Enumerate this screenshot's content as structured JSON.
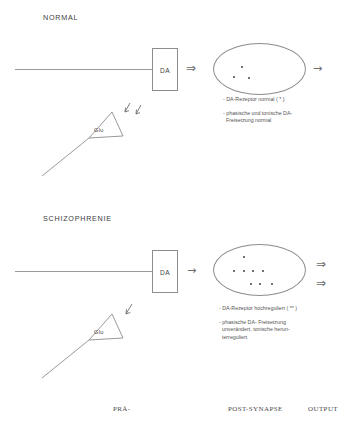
{
  "figure": {
    "panels": [
      {
        "id": "normal",
        "heading": "NORMAL",
        "terminal_label": "DA",
        "vesicle_label": "Glu",
        "glu_arrow_count": 2,
        "release_arrow": "⇒",
        "output_arrows": [
          "→"
        ],
        "receptor_count": 3,
        "notes": [
          "- DA-Rezeptor normal ( * )"
        ],
        "notes_multiline": [
          [
            "- phasische und tonische DA-",
            "  Freisetzung normal"
          ]
        ]
      },
      {
        "id": "schizophrenie",
        "heading": "SCHIZOPHRENIE",
        "terminal_label": "DA",
        "vesicle_label": "Glu",
        "glu_arrow_count": 1,
        "release_arrow": "→",
        "output_arrows": [
          "⇒",
          "⇒"
        ],
        "receptor_count": 8,
        "notes": [
          "- DA-Rezeptor hochreguliert ( ** )"
        ],
        "notes_multiline": [
          [
            "- phasische DA- Freisetzung",
            "  unverändert, tonische herun-",
            "  terreguliert"
          ]
        ]
      }
    ],
    "footer": {
      "presynapse": "PRÄ-",
      "postsynapse": "POST-SYNAPSE",
      "output": "OUTPUT"
    },
    "colors": {
      "stroke": "#8d8d8d",
      "text": "#4a4a4a",
      "receptor": "#555555"
    }
  }
}
